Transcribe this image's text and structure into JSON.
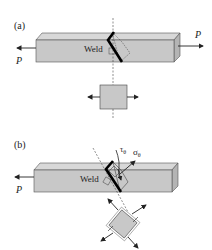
{
  "panel_a": {
    "label": "(a)",
    "weld_label": "Weld",
    "load_left": "P",
    "load_right": "P"
  },
  "panel_b": {
    "label": "(b)",
    "weld_label": "Weld",
    "load_left": "P",
    "shear_stress": "τθ",
    "normal_stress": "σθ"
  },
  "colors": {
    "bar_fill": "#c8c8c8",
    "bar_top": "#d8d8d8",
    "bar_side": "#b4b4b4",
    "stroke": "#222222"
  }
}
